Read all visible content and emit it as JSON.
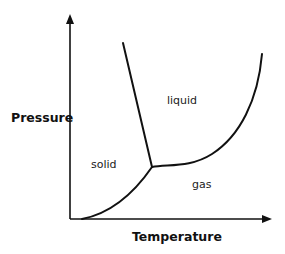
{
  "diagram": {
    "axes": {
      "x_label": "Temperature",
      "y_label": "Pressure"
    },
    "regions": {
      "solid": "solid",
      "liquid": "liquid",
      "gas": "gas"
    },
    "curves": [
      {
        "name": "solid-liquid boundary",
        "from": "triple point",
        "to": "top"
      },
      {
        "name": "liquid-gas boundary",
        "from": "triple point",
        "to": "top right"
      },
      {
        "name": "solid-gas boundary",
        "from": "origin",
        "to": "triple point"
      }
    ],
    "colors": {
      "line": "#111111",
      "background": "#ffffff"
    }
  }
}
